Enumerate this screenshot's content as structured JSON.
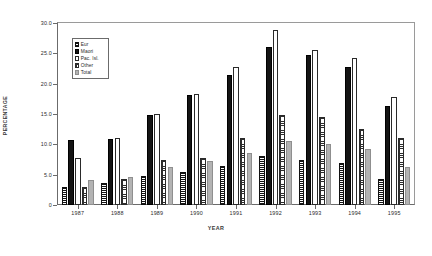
{
  "chart_data": {
    "type": "bar",
    "title": "",
    "subtitle": "",
    "xlabel": "YEAR",
    "ylabel": "PERCENTAGE",
    "categories": [
      "1987",
      "1988",
      "1989",
      "1990",
      "1991",
      "1992",
      "1993",
      "1994",
      "1995"
    ],
    "ylim": [
      0,
      30
    ],
    "ytick_values": [
      0,
      5,
      10,
      15,
      20,
      25,
      30
    ],
    "ytick_labels": [
      "0",
      "5.0",
      "10.0",
      "15.0",
      "20.0",
      "25.0",
      "30.0"
    ],
    "grid": false,
    "legend_position": "upper-left-inside",
    "series": [
      {
        "name": "Eur",
        "fill": "black-horizontal-lines",
        "color": "#1a1a1a",
        "values": [
          3.0,
          3.7,
          4.8,
          5.5,
          6.5,
          8.0,
          7.5,
          7.0,
          4.3
        ]
      },
      {
        "name": "Maori",
        "fill": "solid-black",
        "color": "#141414",
        "values": [
          10.7,
          10.8,
          14.8,
          18.2,
          21.5,
          26.0,
          24.7,
          22.7,
          16.3
        ]
      },
      {
        "name": "Pac. Isl.",
        "fill": "white-outline",
        "color": "#ffffff",
        "values": [
          7.7,
          11.0,
          15.0,
          18.3,
          22.8,
          28.8,
          25.5,
          24.3,
          17.8
        ]
      },
      {
        "name": "Other",
        "fill": "black-crosshatch",
        "color": "#2e2e2e",
        "values": [
          3.0,
          4.3,
          7.5,
          7.8,
          11.0,
          14.8,
          14.5,
          12.5,
          11.0
        ]
      },
      {
        "name": "Total",
        "fill": "light-grey",
        "color": "#b3b3b3",
        "values": [
          4.2,
          4.7,
          6.3,
          7.3,
          8.5,
          10.5,
          10.0,
          9.3,
          6.2
        ]
      }
    ]
  }
}
